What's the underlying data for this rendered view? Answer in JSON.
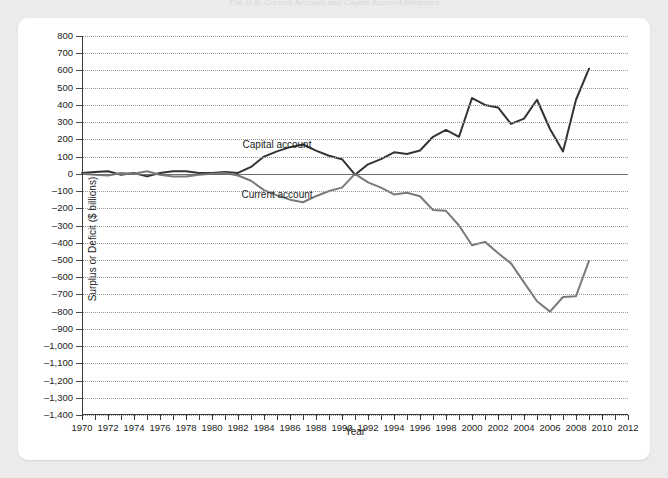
{
  "page": {
    "faint_top_text": "The U.S. Current Account and Capital Account Balances"
  },
  "chart_data": {
    "type": "line",
    "title": "",
    "xlabel": "Year",
    "ylabel": "Surplus or Deficit ($ billions)",
    "xlim": [
      1970,
      2012
    ],
    "ylim": [
      -1400,
      800
    ],
    "grid": true,
    "legend_position": "inline-annotations",
    "yticks": [
      800,
      700,
      600,
      500,
      400,
      300,
      200,
      100,
      0,
      -100,
      -200,
      -300,
      -400,
      -500,
      -600,
      -700,
      -800,
      -900,
      -1000,
      -1100,
      -1200,
      -1300,
      -1400
    ],
    "ytick_labels": [
      "800",
      "700",
      "600",
      "500",
      "400",
      "300",
      "200",
      "100",
      "0",
      "–100",
      "–200",
      "–300",
      "–400",
      "–500",
      "–600",
      "–700",
      "–800",
      "–900",
      "–1,000",
      "–1,100",
      "–1,200",
      "–1,300",
      "–1,400"
    ],
    "xticks": [
      1970,
      1972,
      1974,
      1976,
      1978,
      1980,
      1982,
      1984,
      1986,
      1988,
      1990,
      1992,
      1994,
      1996,
      1998,
      2000,
      2002,
      2004,
      2006,
      2008,
      2010,
      2012
    ],
    "xtick_labels": [
      "1970",
      "1972",
      "1974",
      "1976",
      "1978",
      "1980",
      "1982",
      "1984",
      "1986",
      "1988",
      "1990",
      "1992",
      "1994",
      "1996",
      "1998",
      "2000",
      "2002",
      "2004",
      "2006",
      "2008",
      "2010",
      "2012"
    ],
    "x": [
      1970,
      1971,
      1972,
      1973,
      1974,
      1975,
      1976,
      1977,
      1978,
      1979,
      1980,
      1981,
      1982,
      1983,
      1984,
      1985,
      1986,
      1987,
      1988,
      1989,
      1990,
      1991,
      1992,
      1993,
      1994,
      1995,
      1996,
      1997,
      1998,
      1999,
      2000,
      2001,
      2002,
      2003,
      2004,
      2005,
      2006,
      2007,
      2008,
      2009
    ],
    "series": [
      {
        "name": "Capital account",
        "color": "#333333",
        "label_x": 1985,
        "label_y": 175,
        "values": [
          5,
          10,
          15,
          -5,
          5,
          -15,
          5,
          15,
          15,
          5,
          5,
          10,
          5,
          40,
          100,
          130,
          155,
          170,
          135,
          105,
          85,
          -5,
          55,
          85,
          125,
          115,
          135,
          215,
          255,
          215,
          440,
          400,
          385,
          290,
          320,
          430,
          260,
          130,
          430,
          610
        ]
      },
      {
        "name": "Current account",
        "color": "#7a7a7a",
        "label_x": 1985,
        "label_y": -120,
        "values": [
          0,
          -5,
          -10,
          5,
          0,
          15,
          -5,
          -15,
          -15,
          -5,
          0,
          5,
          -10,
          -40,
          -95,
          -125,
          -150,
          -165,
          -130,
          -100,
          -80,
          0,
          -50,
          -80,
          -120,
          -110,
          -130,
          -210,
          -215,
          -300,
          -415,
          -395,
          -460,
          -520,
          -630,
          -740,
          -800,
          -715,
          -710,
          -505
        ]
      }
    ]
  }
}
